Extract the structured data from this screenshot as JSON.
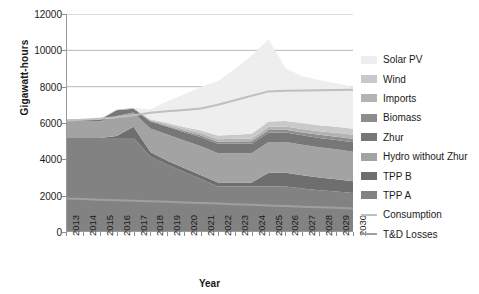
{
  "chart_data": {
    "type": "area",
    "title": "",
    "xlabel": "Year",
    "ylabel": "Gigawatt-hours",
    "xlim": [
      2013,
      2030
    ],
    "ylim": [
      0,
      12000
    ],
    "yticks": [
      0,
      2000,
      4000,
      6000,
      8000,
      10000,
      12000
    ],
    "grid": true,
    "legend_position": "right",
    "stacked": true,
    "categories": [
      2013,
      2014,
      2015,
      2016,
      2017,
      2018,
      2019,
      2020,
      2021,
      2022,
      2023,
      2024,
      2025,
      2026,
      2027,
      2028,
      2029,
      2030
    ],
    "x_tick_labels": [
      "2013",
      "2014",
      "2015",
      "2016",
      "2017",
      "2018",
      "2019",
      "2020",
      "2021",
      "2022",
      "2023",
      "2024",
      "2025",
      "2026",
      "2027",
      "2028",
      "2029",
      "2030"
    ],
    "y_tick_labels": [
      "0",
      "2000",
      "4000",
      "6000",
      "8000",
      "10000",
      "12000"
    ],
    "series": [
      {
        "name": "TPP A",
        "color": "#828282",
        "type": "area",
        "values": [
          5180,
          5180,
          5180,
          5180,
          5180,
          4150,
          3700,
          3300,
          2900,
          2500,
          2500,
          2500,
          2500,
          2500,
          2400,
          2300,
          2230,
          2150
        ]
      },
      {
        "name": "TPP B",
        "color": "#6e6e6e",
        "type": "area",
        "values": [
          0,
          0,
          0,
          100,
          620,
          250,
          220,
          220,
          220,
          220,
          220,
          220,
          760,
          760,
          720,
          700,
          680,
          650
        ]
      },
      {
        "name": "Hydro without Zhur",
        "color": "#a3a3a3",
        "type": "area",
        "values": [
          900,
          900,
          900,
          1100,
          780,
          1300,
          1450,
          1520,
          1600,
          1620,
          1620,
          1620,
          1700,
          1700,
          1680,
          1660,
          1640,
          1620
        ]
      },
      {
        "name": "Zhur",
        "color": "#777777",
        "type": "area",
        "values": [
          100,
          100,
          100,
          320,
          200,
          380,
          420,
          450,
          500,
          520,
          520,
          520,
          520,
          520,
          520,
          520,
          520,
          520
        ]
      },
      {
        "name": "Biomass",
        "color": "#8d8d8d",
        "type": "area",
        "values": [
          0,
          0,
          0,
          0,
          0,
          30,
          50,
          70,
          90,
          110,
          120,
          130,
          140,
          150,
          160,
          170,
          180,
          190
        ]
      },
      {
        "name": "Imports",
        "color": "#b3b3b3",
        "type": "area",
        "values": [
          20,
          20,
          20,
          30,
          40,
          60,
          80,
          100,
          120,
          140,
          150,
          160,
          170,
          180,
          190,
          200,
          210,
          220
        ]
      },
      {
        "name": "Wind",
        "color": "#c9c9c9",
        "type": "area",
        "values": [
          0,
          0,
          0,
          0,
          0,
          40,
          80,
          120,
          160,
          200,
          230,
          260,
          290,
          300,
          310,
          320,
          330,
          340
        ]
      },
      {
        "name": "Solar PV",
        "color": "#eeeeee",
        "type": "area",
        "values": [
          0,
          0,
          0,
          0,
          0,
          550,
          1200,
          1800,
          2400,
          3000,
          3600,
          4300,
          4530,
          2900,
          2600,
          2500,
          2400,
          2300
        ]
      }
    ],
    "lines": [
      {
        "name": "Consumption",
        "color": "#bfbfbf",
        "values": [
          6130,
          6180,
          6240,
          6320,
          6430,
          6560,
          6650,
          6720,
          6800,
          7000,
          7250,
          7500,
          7740,
          7780,
          7790,
          7800,
          7810,
          7830
        ]
      },
      {
        "name": "T&D Losses",
        "color": "#9f9f9f",
        "values": [
          1850,
          1815,
          1780,
          1750,
          1720,
          1690,
          1660,
          1630,
          1600,
          1565,
          1530,
          1495,
          1460,
          1425,
          1390,
          1360,
          1330,
          1300
        ]
      }
    ],
    "legend_entries": [
      {
        "label": "Solar PV",
        "color": "#eeeeee",
        "marker": "swatch"
      },
      {
        "label": "Wind",
        "color": "#c9c9c9",
        "marker": "swatch"
      },
      {
        "label": "Imports",
        "color": "#b3b3b3",
        "marker": "swatch"
      },
      {
        "label": "Biomass",
        "color": "#8d8d8d",
        "marker": "swatch"
      },
      {
        "label": "Zhur",
        "color": "#777777",
        "marker": "swatch"
      },
      {
        "label": "Hydro without Zhur",
        "color": "#a3a3a3",
        "marker": "swatch"
      },
      {
        "label": "TPP B",
        "color": "#6e6e6e",
        "marker": "swatch"
      },
      {
        "label": "TPP A",
        "color": "#828282",
        "marker": "swatch"
      },
      {
        "label": "Consumption",
        "color": "#bfbfbf",
        "marker": "line"
      },
      {
        "label": "T&D Losses",
        "color": "#9f9f9f",
        "marker": "line"
      }
    ]
  }
}
